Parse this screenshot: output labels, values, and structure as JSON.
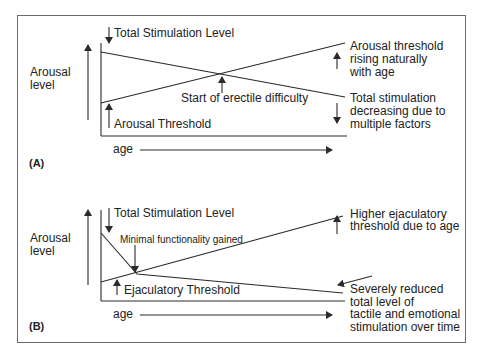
{
  "panels": {
    "a": {
      "id": "(A)",
      "y_label_line1": "Arousal",
      "y_label_line2": "level",
      "x_label": "age",
      "stim_label": "Total Stimulation Level",
      "threshold_label": "Arousal Threshold",
      "crossing_label": "Start of erectile difficulty",
      "right_top": [
        "Arousal threshold",
        "rising naturally",
        "with age"
      ],
      "right_bottom": [
        "Total stimulation",
        "decreasing due to",
        "multiple factors"
      ]
    },
    "b": {
      "id": "(B)",
      "y_label_line1": "Arousal",
      "y_label_line2": "level",
      "x_label": "age",
      "stim_label": "Total Stimulation Level",
      "crossing_label": "Minimal functionality gained",
      "threshold_label": "Ejaculatory Threshold",
      "right_top": [
        "Higher ejaculatory",
        "threshold due to age"
      ],
      "right_bottom": [
        "Severely reduced",
        "total level of",
        "tactile and emotional",
        "stimulation over time"
      ]
    }
  },
  "colors": {
    "line": "#2a2a2a",
    "frame": "#6a6a6a",
    "text": "#222222"
  }
}
